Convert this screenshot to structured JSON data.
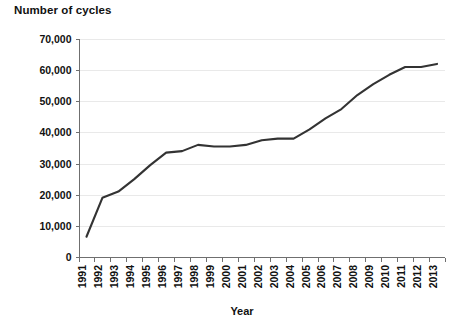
{
  "chart_data": {
    "type": "line",
    "title": "Number of cycles",
    "xlabel": "Year",
    "ylabel": "",
    "grid": true,
    "legend": false,
    "ylim": [
      0,
      70000
    ],
    "yticks": [
      0,
      10000,
      20000,
      30000,
      40000,
      50000,
      60000,
      70000
    ],
    "ytick_labels": [
      "0",
      "10,000",
      "20,000",
      "30,000",
      "40,000",
      "50,000",
      "60,000",
      "70,000"
    ],
    "categories": [
      "1991",
      "1992",
      "1993",
      "1994",
      "1995",
      "1996",
      "1997",
      "1998",
      "1999",
      "2000",
      "2001",
      "2002",
      "2003",
      "2004",
      "2005",
      "2006",
      "2007",
      "2008",
      "2009",
      "2010",
      "2011",
      "2012",
      "2013"
    ],
    "series": [
      {
        "name": "Number of cycles",
        "color": "#333333",
        "values": [
          6500,
          19000,
          21000,
          25000,
          29500,
          33500,
          34000,
          36000,
          35500,
          35500,
          36000,
          37500,
          38000,
          38000,
          41000,
          44500,
          47500,
          52000,
          55500,
          58500,
          61000,
          61000,
          62000
        ]
      }
    ]
  },
  "colors": {
    "line": "#333333",
    "gridline": "#e9e9e9",
    "axis": "#6f6f6f",
    "text": "#111111",
    "background": "#ffffff"
  }
}
